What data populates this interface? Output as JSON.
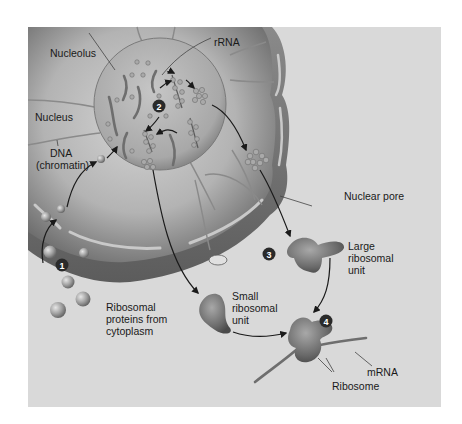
{
  "figure": {
    "background_color": "#d9d9d9",
    "page_color": "#ffffff"
  },
  "labels": {
    "nucleolus": "Nucleolus",
    "rrna": "rRNA",
    "nucleus": "Nucleus",
    "dna_line1": "DNA",
    "dna_line2": "(chromatin)",
    "nuclear_pore": "Nuclear pore",
    "large_unit_line1": "Large",
    "large_unit_line2": "ribosomal",
    "large_unit_line3": "unit",
    "small_unit_line1": "Small",
    "small_unit_line2": "ribosomal",
    "small_unit_line3": "unit",
    "proteins_line1": "Ribosomal",
    "proteins_line2": "proteins from",
    "proteins_line3": "cytoplasm",
    "mrna": "mRNA",
    "ribosome": "Ribosome"
  },
  "steps": [
    {
      "number": "1"
    },
    {
      "number": "2"
    },
    {
      "number": "3"
    },
    {
      "number": "4"
    }
  ],
  "icons": {
    "step_marker": "numbered-circle",
    "flow_arrow": "curved-arrow"
  }
}
